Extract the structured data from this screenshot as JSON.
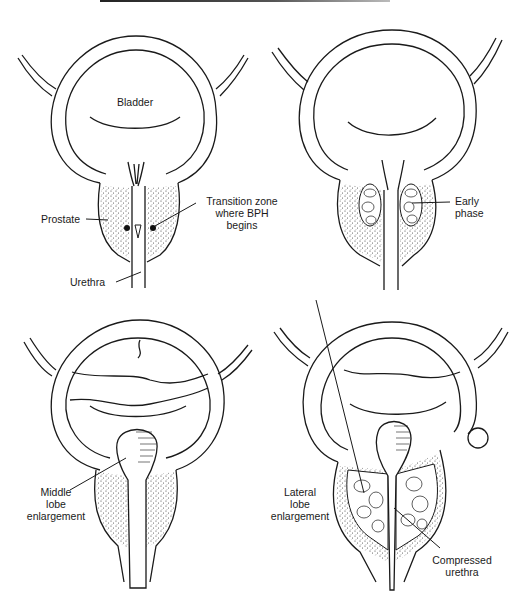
{
  "figure": {
    "panels": [
      {
        "id": "normal",
        "labels": {
          "bladder": "Bladder",
          "prostate": "Prostate",
          "transition_zone_line1": "Transition zone",
          "transition_zone_line2": "where BPH",
          "transition_zone_line3": "begins",
          "urethra": "Urethra"
        }
      },
      {
        "id": "early",
        "labels": {
          "early_line1": "Early",
          "early_line2": "phase"
        }
      },
      {
        "id": "middle-lobe",
        "labels": {
          "middle_line1": "Middle",
          "middle_line2": "lobe",
          "middle_line3": "enlargement"
        }
      },
      {
        "id": "lateral-lobe",
        "labels": {
          "lateral_line1": "Lateral",
          "lateral_line2": "lobe",
          "lateral_line3": "enlargement",
          "compressed_line1": "Compressed",
          "compressed_line2": "urethra"
        }
      }
    ]
  },
  "colors": {
    "ink": "#1a1a1a",
    "background": "#ffffff"
  }
}
